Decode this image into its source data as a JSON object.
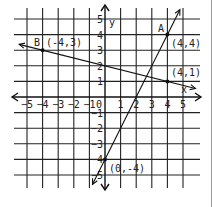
{
  "chart_data": {
    "type": "line",
    "title": "",
    "xlabel": "x",
    "ylabel": "y",
    "xlim": [
      -5,
      5
    ],
    "ylim": [
      -5,
      5
    ],
    "grid": true,
    "x_ticks": [
      "-5",
      "-4",
      "-3",
      "-2",
      "-1",
      "0",
      "1",
      "2",
      "3",
      "4",
      "5"
    ],
    "y_ticks": [
      "5",
      "4",
      "3",
      "2",
      "1",
      "-1",
      "-2",
      "-3",
      "-4",
      "-5"
    ],
    "series": [
      {
        "name": "A",
        "label": "A",
        "equation": "y = 2x - 4",
        "points": [
          {
            "x": 0,
            "y": -4,
            "label": "(0,-4)"
          },
          {
            "x": 4,
            "y": 4,
            "label": "(4,4)"
          }
        ]
      },
      {
        "name": "B",
        "label": "B",
        "equation": "y = -x/4 + 2",
        "points": [
          {
            "x": -4,
            "y": 3,
            "label": "(-4,3)"
          },
          {
            "x": 4,
            "y": 1,
            "label": "(4,1)"
          }
        ]
      }
    ],
    "annotations": [
      "A",
      "B",
      "(4,4)",
      "(4,1)",
      "(-4,3)",
      "(0,-4)"
    ]
  },
  "colors": {
    "ink": "#111111",
    "grid": "#222222",
    "background": "#ffffff"
  }
}
